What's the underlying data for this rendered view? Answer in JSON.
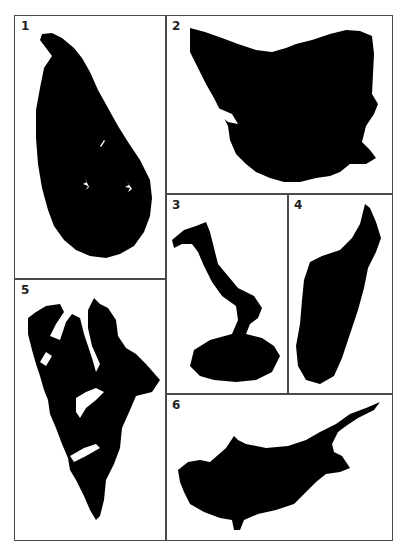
{
  "figure": {
    "panels": [
      {
        "id": "1",
        "label": "1",
        "shape": "sri-lanka-silhouette"
      },
      {
        "id": "2",
        "label": "2",
        "shape": "tasmania-silhouette"
      },
      {
        "id": "3",
        "label": "3",
        "shape": "isabela-island-silhouette"
      },
      {
        "id": "4",
        "label": "4",
        "shape": "madagascar-silhouette"
      },
      {
        "id": "5",
        "label": "5",
        "shape": "spitsbergen-silhouette"
      },
      {
        "id": "6",
        "label": "6",
        "shape": "cyprus-silhouette"
      }
    ],
    "colors": {
      "border": "#4a4a4a",
      "shape": "#000000",
      "background": "#ffffff"
    }
  }
}
